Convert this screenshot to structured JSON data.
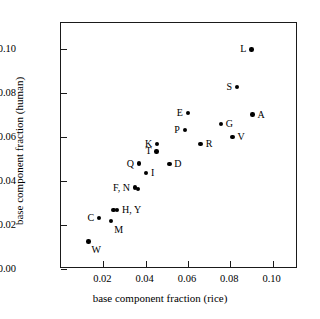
{
  "chart_data": {
    "type": "scatter",
    "title": "",
    "xlabel": "base component fraction (rice)",
    "ylabel": "base component fraction (human)",
    "xlim": [
      0.0,
      0.112
    ],
    "ylim": [
      0.0,
      0.112
    ],
    "xticks": [
      0.02,
      0.04,
      0.06,
      0.08,
      0.1
    ],
    "xticklabels": [
      "0.02",
      "0.04",
      "0.06",
      "0.08",
      "0.10"
    ],
    "yticks": [
      0.0,
      0.02,
      0.04,
      0.06,
      0.08,
      0.1
    ],
    "yticklabels": [
      "0.00",
      "0.02",
      "0.04",
      "0.06",
      "0.08",
      "0.10"
    ],
    "grid": false,
    "legend": "none",
    "marker": "filled-circle",
    "marker_color": "#000000",
    "points": [
      {
        "label": "L",
        "x": 0.09,
        "y": 0.1,
        "label_pos": "left"
      },
      {
        "label": "S",
        "x": 0.0832,
        "y": 0.083,
        "label_pos": "left"
      },
      {
        "label": "A",
        "x": 0.0905,
        "y": 0.0703,
        "label_pos": "right"
      },
      {
        "label": "E",
        "x": 0.06,
        "y": 0.071,
        "label_pos": "left"
      },
      {
        "label": "G",
        "x": 0.0755,
        "y": 0.066,
        "label_pos": "right"
      },
      {
        "label": "P",
        "x": 0.0585,
        "y": 0.0632,
        "label_pos": "left"
      },
      {
        "label": "V",
        "x": 0.081,
        "y": 0.06,
        "label_pos": "right"
      },
      {
        "label": "K",
        "x": 0.0455,
        "y": 0.057,
        "label_pos": "left"
      },
      {
        "label": "R",
        "x": 0.066,
        "y": 0.057,
        "label_pos": "right"
      },
      {
        "label": "T",
        "x": 0.0452,
        "y": 0.0535,
        "label_pos": "left"
      },
      {
        "label": "Q",
        "x": 0.0368,
        "y": 0.048,
        "label_pos": "left"
      },
      {
        "label": "D",
        "x": 0.0512,
        "y": 0.0478,
        "label_pos": "right"
      },
      {
        "label": "I",
        "x": 0.0402,
        "y": 0.0437,
        "label_pos": "right"
      },
      {
        "label": "F, N",
        "x": 0.035,
        "y": 0.0371,
        "label_pos": "left"
      },
      {
        "label": "",
        "x": 0.0365,
        "y": 0.0363,
        "label_pos": "none"
      },
      {
        "label": "H, Y",
        "x": 0.0265,
        "y": 0.027,
        "label_pos": "right"
      },
      {
        "label": "",
        "x": 0.0248,
        "y": 0.0268,
        "label_pos": "none"
      },
      {
        "label": "C",
        "x": 0.018,
        "y": 0.0232,
        "label_pos": "left"
      },
      {
        "label": "M",
        "x": 0.0237,
        "y": 0.0218,
        "label_pos": "below-right"
      },
      {
        "label": "W",
        "x": 0.013,
        "y": 0.0126,
        "label_pos": "below-right"
      }
    ]
  }
}
